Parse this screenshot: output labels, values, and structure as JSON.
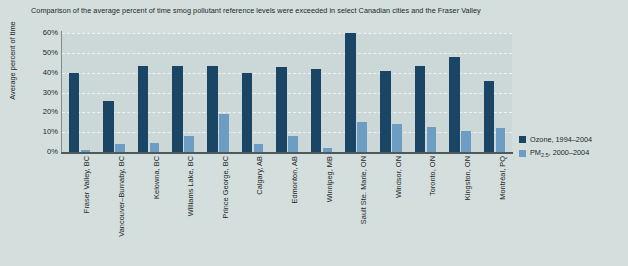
{
  "chart_data": {
    "type": "bar",
    "title": "Comparison of the average percent of time smog pollutant reference levels were exceeded in select Canadian cities and the Fraser Valley",
    "xlabel": "",
    "ylabel": "Average percent of time",
    "ylim": [
      0,
      60
    ],
    "ytick_labels": [
      "60%",
      "50%",
      "40%",
      "30%",
      "20%",
      "10%",
      "0%"
    ],
    "ytick_values": [
      60,
      50,
      40,
      30,
      20,
      10,
      0
    ],
    "grid": true,
    "legend_position": "right",
    "categories": [
      "Fraser Valley, BC",
      "Vancouver–Burnaby, BC",
      "Kelowna, BC",
      "Williams Lake, BC",
      "Prince George, BC",
      "Calgary, AB",
      "Edmonton, AB",
      "Winnipeg, MB",
      "Sault Ste. Marie, ON",
      "Windsor, ON",
      "Toronto, ON",
      "Kingston, ON",
      "Montréal, PQ"
    ],
    "series": [
      {
        "name": "Ozone, 1994–2004",
        "name_prefix": "Ozone, 1994–2004",
        "subscript": "",
        "name_suffix": "",
        "color": "#1b4565",
        "values": [
          40,
          25.5,
          43.5,
          43.5,
          43.5,
          40,
          43,
          42,
          60,
          41,
          43.5,
          48,
          36
        ]
      },
      {
        "name": "PM2.5, 2000–2004",
        "name_prefix": "PM",
        "subscript": "2.5",
        "name_suffix": ", 2000–2004",
        "color": "#6e9dc4",
        "values": [
          1,
          4,
          4.5,
          8,
          19,
          4,
          8,
          2,
          15,
          14,
          12.5,
          10.5,
          12
        ]
      }
    ]
  },
  "colors": {
    "background": "#d4dedc",
    "plot_background": "#ccd8d7",
    "ozone": "#1b4565",
    "pm25": "#6e9dc4",
    "axis": "#4c5a5c",
    "gridline": "#eef3f2",
    "text": "#23282b"
  }
}
